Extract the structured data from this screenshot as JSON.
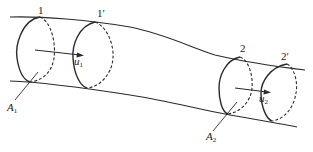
{
  "diagram": {
    "line_color": "#2a2a2a",
    "sections": [
      {
        "id": "1",
        "label": "1"
      },
      {
        "id": "1p",
        "label": "1′"
      },
      {
        "id": "2",
        "label": "2"
      },
      {
        "id": "2p",
        "label": "2′"
      }
    ],
    "velocities": [
      {
        "symbol": "u",
        "subscript": "1"
      },
      {
        "symbol": "u",
        "subscript": "2"
      }
    ],
    "areas": [
      {
        "symbol": "A",
        "subscript": "1"
      },
      {
        "symbol": "A",
        "subscript": "2"
      }
    ]
  }
}
